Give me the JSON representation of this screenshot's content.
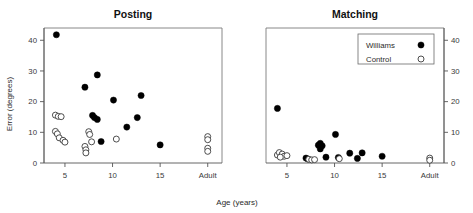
{
  "figure": {
    "xlabel": "Age (years)",
    "ylabel": "Error (degrees)",
    "legend": {
      "series": [
        {
          "label": "Williams",
          "marker": "filled-circle"
        },
        {
          "label": "Control",
          "marker": "open-circle"
        }
      ],
      "position": "top-right-of-matching-panel"
    }
  },
  "chart_data": [
    {
      "type": "scatter",
      "title": "Posting",
      "xlabel": "Age (years)",
      "ylabel": "Error (degrees)",
      "xlim": [
        2.8,
        21.5
      ],
      "ylim": [
        0,
        44
      ],
      "xticks": [
        5,
        10,
        15,
        20
      ],
      "xticklabels": [
        "5",
        "10",
        "15",
        "Adult"
      ],
      "yticks": [
        0,
        10,
        20,
        30,
        40
      ],
      "yticklabels": [
        "0",
        "10",
        "20",
        "30",
        "40"
      ],
      "yaxis_side": "left",
      "grid": false,
      "series": [
        {
          "name": "Williams",
          "marker": "filled-circle",
          "points": [
            {
              "x": 4.1,
              "y": 41.8
            },
            {
              "x": 7.1,
              "y": 24.7
            },
            {
              "x": 8.4,
              "y": 28.7
            },
            {
              "x": 7.9,
              "y": 15.5
            },
            {
              "x": 8.1,
              "y": 14.8
            },
            {
              "x": 8.4,
              "y": 14.2
            },
            {
              "x": 8.8,
              "y": 7.0
            },
            {
              "x": 10.1,
              "y": 20.5
            },
            {
              "x": 11.5,
              "y": 11.7
            },
            {
              "x": 12.6,
              "y": 14.8
            },
            {
              "x": 13.0,
              "y": 22.0
            },
            {
              "x": 15.0,
              "y": 5.9
            }
          ]
        },
        {
          "name": "Control",
          "marker": "open-circle",
          "points": [
            {
              "x": 4.0,
              "y": 15.6
            },
            {
              "x": 4.3,
              "y": 15.2
            },
            {
              "x": 4.6,
              "y": 15.1
            },
            {
              "x": 4.0,
              "y": 10.3
            },
            {
              "x": 4.2,
              "y": 9.5
            },
            {
              "x": 4.4,
              "y": 8.2
            },
            {
              "x": 4.8,
              "y": 7.4
            },
            {
              "x": 5.0,
              "y": 6.8
            },
            {
              "x": 7.5,
              "y": 10.2
            },
            {
              "x": 7.6,
              "y": 9.3
            },
            {
              "x": 7.1,
              "y": 5.4
            },
            {
              "x": 7.2,
              "y": 4.3
            },
            {
              "x": 7.2,
              "y": 3.3
            },
            {
              "x": 7.8,
              "y": 6.9
            },
            {
              "x": 10.4,
              "y": 7.8
            },
            {
              "x": 20.0,
              "y": 8.6
            },
            {
              "x": 20.0,
              "y": 7.6
            },
            {
              "x": 20.0,
              "y": 4.8
            },
            {
              "x": 20.0,
              "y": 3.8
            }
          ]
        }
      ]
    },
    {
      "type": "scatter",
      "title": "Matching",
      "xlabel": "Age (years)",
      "ylabel": "Error (degrees)",
      "xlim": [
        2.8,
        21.5
      ],
      "ylim": [
        0,
        44
      ],
      "xticks": [
        5,
        10,
        15,
        20
      ],
      "xticklabels": [
        "5",
        "10",
        "15",
        "Adult"
      ],
      "yticks": [
        0,
        10,
        20,
        30,
        40
      ],
      "yticklabels": [
        "0",
        "10",
        "20",
        "30",
        "40"
      ],
      "yaxis_side": "right",
      "grid": false,
      "series": [
        {
          "name": "Williams",
          "marker": "filled-circle",
          "points": [
            {
              "x": 4.0,
              "y": 17.8
            },
            {
              "x": 7.0,
              "y": 1.6
            },
            {
              "x": 7.2,
              "y": 1.3
            },
            {
              "x": 8.3,
              "y": 5.8
            },
            {
              "x": 8.5,
              "y": 6.4
            },
            {
              "x": 8.7,
              "y": 5.6
            },
            {
              "x": 8.5,
              "y": 4.6
            },
            {
              "x": 9.1,
              "y": 1.9
            },
            {
              "x": 10.1,
              "y": 9.3
            },
            {
              "x": 10.4,
              "y": 1.8
            },
            {
              "x": 11.6,
              "y": 3.2
            },
            {
              "x": 12.4,
              "y": 1.5
            },
            {
              "x": 12.9,
              "y": 3.3
            },
            {
              "x": 15.0,
              "y": 2.2
            }
          ]
        },
        {
          "name": "Control",
          "marker": "open-circle",
          "points": [
            {
              "x": 4.0,
              "y": 2.6
            },
            {
              "x": 4.2,
              "y": 3.4
            },
            {
              "x": 4.5,
              "y": 2.9
            },
            {
              "x": 4.7,
              "y": 2.2
            },
            {
              "x": 5.0,
              "y": 2.4
            },
            {
              "x": 4.3,
              "y": 1.9
            },
            {
              "x": 7.3,
              "y": 1.2
            },
            {
              "x": 7.6,
              "y": 1.0
            },
            {
              "x": 7.9,
              "y": 1.1
            },
            {
              "x": 10.5,
              "y": 1.4
            },
            {
              "x": 20.0,
              "y": 1.6
            },
            {
              "x": 20.0,
              "y": 0.9
            }
          ]
        }
      ]
    }
  ]
}
